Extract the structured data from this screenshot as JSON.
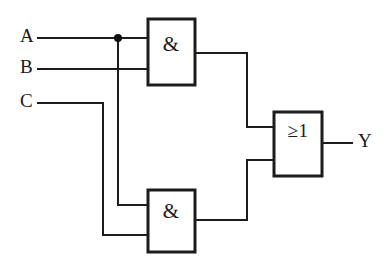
{
  "diagram": {
    "type": "logic-gate-schematic",
    "line_color": "#1c1c1c",
    "background_color": "#ffffff"
  },
  "inputs": [
    {
      "id": "A",
      "label": "A",
      "x": 26,
      "y": 38
    },
    {
      "id": "B",
      "label": "B",
      "x": 26,
      "y": 69
    },
    {
      "id": "C",
      "label": "C",
      "x": 26,
      "y": 103
    }
  ],
  "outputs": [
    {
      "id": "Y",
      "label": "Y",
      "x": 360,
      "y": 143
    }
  ],
  "gates": [
    {
      "id": "and-top",
      "symbol": "&",
      "type": "AND",
      "x": 148,
      "y": 19,
      "width": 47,
      "height": 66,
      "label_x": 171,
      "label_y": 46,
      "input_pins": [
        38,
        69
      ],
      "output_pin": 53
    },
    {
      "id": "and-bottom",
      "symbol": "&",
      "type": "AND",
      "x": 148,
      "y": 190,
      "width": 47,
      "height": 62,
      "label_x": 171,
      "label_y": 213,
      "input_pins": [
        205,
        235
      ],
      "output_pin": 220
    },
    {
      "id": "or-out",
      "symbol": "≥1",
      "type": "OR",
      "x": 274,
      "y": 112,
      "width": 48,
      "height": 64,
      "label_x": 298,
      "label_y": 133,
      "input_pins": [
        127,
        160
      ],
      "output_pin": 143
    }
  ],
  "junctions": [
    {
      "id": "a-fanout",
      "x": 118,
      "y": 38,
      "radius": 4
    }
  ],
  "wires": [
    {
      "id": "wire-a-to-and-top",
      "path": "M 38 38 L 148 38"
    },
    {
      "id": "wire-b-to-and-top",
      "path": "M 38 69 L 148 69"
    },
    {
      "id": "wire-a-branch-down",
      "path": "M 118 38 L 118 205 L 148 205"
    },
    {
      "id": "wire-c-to-and-bottom",
      "path": "M 38 103 L 103 103 L 103 235 L 148 235"
    },
    {
      "id": "wire-and-top-to-or",
      "path": "M 195 53 L 247 53 L 247 127 L 274 127"
    },
    {
      "id": "wire-and-bottom-to-or",
      "path": "M 195 220 L 247 220 L 247 160 L 274 160"
    },
    {
      "id": "wire-or-to-output",
      "path": "M 322 143 L 352 143"
    }
  ]
}
